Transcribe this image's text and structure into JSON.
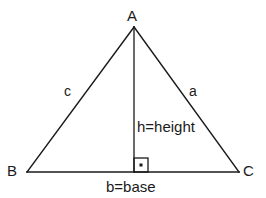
{
  "diagram": {
    "type": "geometry-triangle",
    "canvas": {
      "width": 266,
      "height": 198
    },
    "colors": {
      "background": "#ffffff",
      "stroke": "#1a1a1a",
      "text": "#1a1a1a"
    },
    "vertices": [
      {
        "name": "A",
        "label": "A",
        "x": 134,
        "y": 27
      },
      {
        "name": "B",
        "label": "B",
        "x": 27,
        "y": 172
      },
      {
        "name": "C",
        "label": "C",
        "x": 239,
        "y": 172
      }
    ],
    "sides": [
      {
        "name": "c",
        "label": "c",
        "between": "A-B"
      },
      {
        "name": "a",
        "label": "a",
        "between": "A-C"
      },
      {
        "name": "b",
        "label": "b=base",
        "between": "B-C"
      }
    ],
    "height": {
      "label": "h=height",
      "from_x": 134,
      "from_y": 27,
      "to_x": 134,
      "to_y": 172
    },
    "right_angle_marker": {
      "name": "right-angle-mark",
      "x": 134,
      "y": 158,
      "size": 14,
      "has_center_dot": true
    }
  }
}
